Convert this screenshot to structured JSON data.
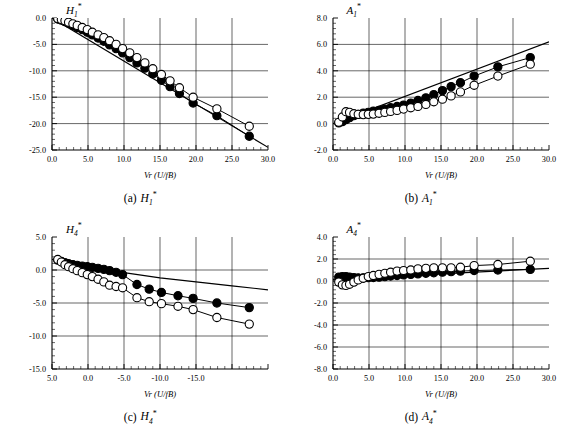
{
  "figure": {
    "xlabel": "Vr (U/fB)",
    "panels": [
      {
        "key": "a",
        "caption_label": "(a)",
        "caption_symbol": "H",
        "caption_sub": "1",
        "caption_sup": "*",
        "title_symbol": "H",
        "title_sub": "1",
        "title_sup": "*"
      },
      {
        "key": "b",
        "caption_label": "(b)",
        "caption_symbol": "A",
        "caption_sub": "1",
        "caption_sup": "*",
        "title_symbol": "A",
        "title_sub": "1",
        "title_sup": "*"
      },
      {
        "key": "c",
        "caption_label": "(c)",
        "caption_symbol": "H",
        "caption_sub": "4",
        "caption_sup": "*",
        "title_symbol": "H",
        "title_sub": "4",
        "title_sup": "*"
      },
      {
        "key": "d",
        "caption_label": "(d)",
        "caption_symbol": "A",
        "caption_sub": "4",
        "caption_sup": "*",
        "title_symbol": "A",
        "title_sub": "4",
        "title_sup": "*"
      }
    ]
  },
  "chart_data": [
    {
      "type": "scatter",
      "panel": "a",
      "title": "H1*",
      "xlabel": "Vr (U/fB)",
      "ylabel": "H1*",
      "xlim": [
        0.0,
        30.0
      ],
      "ylim": [
        -25.0,
        0.0
      ],
      "xticks": [
        0.0,
        5.0,
        10.0,
        15.0,
        20.0,
        25.0,
        30.0
      ],
      "yticks": [
        0.0,
        -5.0,
        -10.0,
        -15.0,
        -20.0,
        -25.0
      ],
      "xticklabels": [
        "0.0",
        "5.0",
        "10.0",
        "15.0",
        "20.0",
        "25.0",
        "30.0"
      ],
      "yticklabels": [
        "0.0",
        "-5.0",
        "-10.0",
        "-15.0",
        "-20.0",
        "-25.0"
      ],
      "grid": true,
      "legend": "none",
      "series": [
        {
          "name": "filled-circles",
          "marker": "filled-circle",
          "x": [
            0.8,
            1.3,
            1.8,
            2.3,
            2.9,
            3.5,
            4.2,
            4.9,
            5.6,
            6.4,
            7.2,
            8.0,
            8.9,
            9.8,
            10.8,
            11.8,
            12.9,
            14.0,
            15.2,
            16.4,
            17.7,
            19.6,
            22.9,
            27.4
          ],
          "y": [
            -0.2,
            -0.4,
            -0.7,
            -1.0,
            -1.4,
            -1.8,
            -2.2,
            -2.7,
            -3.2,
            -3.8,
            -4.4,
            -5.1,
            -5.8,
            -6.6,
            -7.5,
            -8.5,
            -9.5,
            -10.6,
            -11.8,
            -13.0,
            -14.3,
            -16.1,
            -18.5,
            -22.4
          ]
        },
        {
          "name": "open-circles",
          "marker": "open-circle",
          "x": [
            0.8,
            1.3,
            1.8,
            2.3,
            2.9,
            3.5,
            4.2,
            4.9,
            5.6,
            6.4,
            7.2,
            8.0,
            8.9,
            9.8,
            10.8,
            11.8,
            12.9,
            14.0,
            15.2,
            16.4,
            17.7,
            19.6,
            22.9,
            27.4
          ],
          "y": [
            -0.1,
            -0.3,
            -0.5,
            -0.8,
            -1.1,
            -1.4,
            -1.8,
            -2.2,
            -2.7,
            -3.2,
            -3.7,
            -4.3,
            -5.0,
            -5.8,
            -6.6,
            -7.5,
            -8.5,
            -9.6,
            -10.7,
            -11.9,
            -13.2,
            -15.0,
            -17.2,
            -20.5
          ]
        },
        {
          "name": "theory-line",
          "marker": "line",
          "x": [
            0.0,
            30.0
          ],
          "y": [
            0.0,
            -24.5
          ]
        }
      ]
    },
    {
      "type": "scatter",
      "panel": "b",
      "title": "A1*",
      "xlabel": "Vr (U/fB)",
      "ylabel": "A1*",
      "xlim": [
        0.0,
        30.0
      ],
      "ylim": [
        -2.0,
        8.0
      ],
      "xticks": [
        0.0,
        5.0,
        10.0,
        15.0,
        20.0,
        25.0,
        30.0
      ],
      "yticks": [
        8.0,
        6.0,
        4.0,
        2.0,
        0.0,
        -2.0
      ],
      "xticklabels": [
        "0.0",
        "5.0",
        "10.0",
        "15.0",
        "20.0",
        "25.0",
        "30.0"
      ],
      "yticklabels": [
        "8.0",
        "6.0",
        "4.0",
        "2.0",
        "0.0",
        "-2.0"
      ],
      "grid": true,
      "legend": "none",
      "series": [
        {
          "name": "filled-circles",
          "marker": "filled-circle",
          "x": [
            0.8,
            1.3,
            1.8,
            2.3,
            2.9,
            3.5,
            4.2,
            4.9,
            5.6,
            6.4,
            7.2,
            8.0,
            8.9,
            9.8,
            10.8,
            11.8,
            12.9,
            14.0,
            15.2,
            16.4,
            17.7,
            19.6,
            22.9,
            27.4
          ],
          "y": [
            0.05,
            0.15,
            0.3,
            0.45,
            0.6,
            0.7,
            0.8,
            0.85,
            0.95,
            1.0,
            1.1,
            1.2,
            1.3,
            1.4,
            1.55,
            1.75,
            1.95,
            2.2,
            2.5,
            2.8,
            3.1,
            3.6,
            4.3,
            5.0
          ]
        },
        {
          "name": "open-circles",
          "marker": "open-circle",
          "x": [
            0.8,
            1.3,
            1.8,
            2.3,
            2.9,
            3.5,
            4.2,
            4.9,
            5.6,
            6.4,
            7.2,
            8.0,
            8.9,
            9.8,
            10.8,
            11.8,
            12.9,
            14.0,
            15.2,
            16.4,
            17.7,
            19.6,
            22.9,
            27.4
          ],
          "y": [
            0.1,
            0.5,
            0.9,
            0.85,
            0.75,
            0.7,
            0.68,
            0.7,
            0.72,
            0.78,
            0.85,
            0.92,
            1.0,
            1.1,
            1.2,
            1.3,
            1.45,
            1.65,
            1.85,
            2.1,
            2.4,
            2.9,
            3.6,
            4.5
          ]
        },
        {
          "name": "theory-line",
          "marker": "line",
          "x": [
            0.0,
            30.0
          ],
          "y": [
            0.0,
            6.2
          ]
        }
      ]
    },
    {
      "type": "scatter",
      "panel": "c",
      "title": "H4*",
      "xlabel": "Vr (U/fB)",
      "ylabel": "H4*",
      "xlim": [
        0.0,
        30.0
      ],
      "ylim": [
        -15.0,
        5.0
      ],
      "xticks": [
        0.0,
        5.0,
        10.0,
        15.0,
        20.0,
        25.0,
        30.0
      ],
      "yticks": [
        5.0,
        0.0,
        -5.0,
        -10.0,
        -15.0
      ],
      "xticklabels": [
        "5.0",
        "0.0",
        "-5.0",
        "-10.0",
        "-15.0"
      ],
      "yticklabels": [
        "5.0",
        "0.0",
        "-5.0",
        "-10.0",
        "-15.0"
      ],
      "grid": true,
      "legend": "none",
      "series": [
        {
          "name": "filled-circles",
          "marker": "filled-circle",
          "x": [
            0.8,
            1.3,
            1.8,
            2.3,
            2.9,
            3.5,
            4.2,
            4.9,
            5.6,
            6.4,
            7.2,
            8.0,
            8.9,
            9.8,
            11.8,
            13.5,
            15.2,
            17.5,
            19.6,
            22.9,
            27.4
          ],
          "y": [
            1.5,
            1.3,
            1.1,
            0.95,
            0.8,
            0.7,
            0.6,
            0.5,
            0.4,
            0.25,
            0.1,
            -0.1,
            -0.35,
            -0.7,
            -2.2,
            -2.9,
            -3.4,
            -3.9,
            -4.3,
            -5.0,
            -5.7
          ]
        },
        {
          "name": "open-circles",
          "marker": "open-circle",
          "x": [
            0.8,
            1.3,
            1.8,
            2.3,
            2.9,
            3.5,
            4.2,
            4.9,
            5.6,
            6.4,
            7.2,
            8.0,
            8.9,
            9.8,
            11.8,
            13.5,
            15.2,
            17.5,
            19.6,
            22.9,
            27.4
          ],
          "y": [
            1.6,
            1.2,
            0.8,
            0.5,
            0.2,
            -0.1,
            -0.4,
            -0.7,
            -1.0,
            -1.4,
            -1.8,
            -2.3,
            -2.5,
            -2.7,
            -4.2,
            -4.8,
            -5.1,
            -5.5,
            -6.0,
            -7.2,
            -8.2
          ]
        },
        {
          "name": "theory-line",
          "marker": "line",
          "x": [
            0.0,
            5.0,
            10.0,
            15.0,
            20.0,
            25.0,
            30.0
          ],
          "y": [
            1.6,
            0.6,
            -0.4,
            -1.2,
            -1.8,
            -2.4,
            -3.0
          ]
        }
      ]
    },
    {
      "type": "scatter",
      "panel": "d",
      "title": "A4*",
      "xlabel": "Vr (U/fB)",
      "ylabel": "A4*",
      "xlim": [
        0.0,
        30.0
      ],
      "ylim": [
        -8.0,
        4.0
      ],
      "xticks": [
        0.0,
        5.0,
        10.0,
        15.0,
        20.0,
        25.0,
        30.0
      ],
      "yticks": [
        4.0,
        2.0,
        0.0,
        -2.0,
        -4.0,
        -6.0,
        -8.0
      ],
      "xticklabels": [
        "0.0",
        "5.0",
        "10.0",
        "15.0",
        "20.0",
        "25.0",
        "30.0"
      ],
      "yticklabels": [
        "4.0",
        "2.0",
        "0.0",
        "-2.0",
        "-4.0",
        "-6.0",
        "-8.0"
      ],
      "grid": true,
      "legend": "none",
      "series": [
        {
          "name": "filled-circles",
          "marker": "filled-circle",
          "x": [
            0.8,
            1.3,
            1.8,
            2.3,
            2.9,
            3.5,
            4.2,
            4.9,
            5.6,
            6.4,
            7.2,
            8.0,
            8.9,
            9.8,
            10.8,
            11.8,
            12.9,
            14.0,
            15.2,
            16.4,
            17.7,
            19.6,
            22.9,
            27.4
          ],
          "y": [
            0.35,
            0.4,
            0.4,
            0.35,
            0.3,
            0.28,
            0.28,
            0.3,
            0.32,
            0.35,
            0.4,
            0.45,
            0.5,
            0.55,
            0.6,
            0.65,
            0.7,
            0.75,
            0.8,
            0.85,
            0.9,
            0.95,
            1.0,
            1.05
          ]
        },
        {
          "name": "open-circles",
          "marker": "open-circle",
          "x": [
            0.8,
            1.3,
            1.8,
            2.3,
            2.9,
            3.5,
            4.2,
            4.9,
            5.6,
            6.4,
            7.2,
            8.0,
            8.9,
            9.8,
            10.8,
            11.8,
            12.9,
            14.0,
            15.2,
            16.4,
            17.7,
            19.6,
            22.9,
            27.4
          ],
          "y": [
            -0.1,
            -0.35,
            -0.4,
            -0.3,
            -0.1,
            0.1,
            0.25,
            0.4,
            0.5,
            0.6,
            0.7,
            0.8,
            0.9,
            0.95,
            1.0,
            1.1,
            1.15,
            1.2,
            1.2,
            1.2,
            1.25,
            1.4,
            1.5,
            1.8
          ]
        },
        {
          "name": "theory-line",
          "marker": "line",
          "x": [
            0.0,
            30.0
          ],
          "y": [
            0.15,
            1.15
          ]
        }
      ]
    }
  ]
}
